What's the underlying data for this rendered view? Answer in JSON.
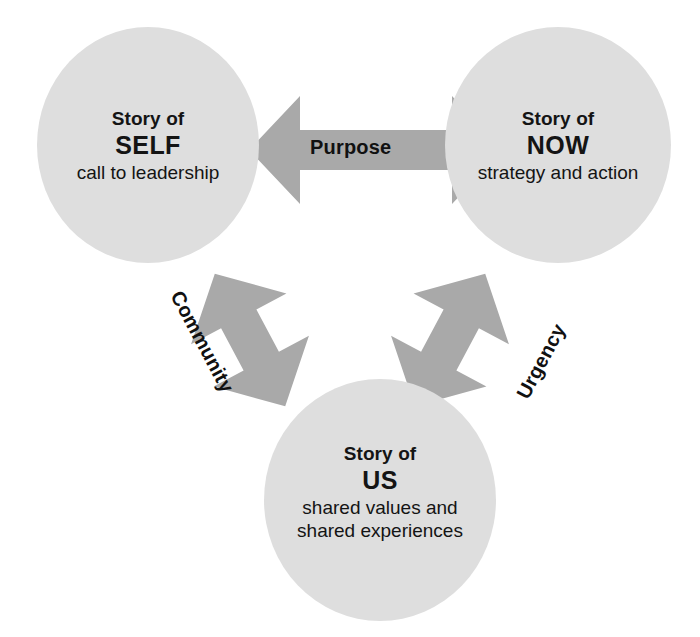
{
  "diagram": {
    "colors": {
      "circle_fill": "#dedede",
      "arrow_fill": "#a9a9a9",
      "text": "#141414",
      "background": "#ffffff"
    },
    "nodes": [
      {
        "id": "self",
        "line_top": "Story of",
        "key": "SELF",
        "subtitle": "call to leadership"
      },
      {
        "id": "now",
        "line_top": "Story of",
        "key": "NOW",
        "subtitle": "strategy and action"
      },
      {
        "id": "us",
        "line_top": "Story of",
        "key": "US",
        "subtitle_line1": "shared values and",
        "subtitle_line2": "shared experiences"
      }
    ],
    "edges": [
      {
        "id": "purpose",
        "label": "Purpose",
        "from": "self",
        "to": "now",
        "orientation": "horizontal",
        "double_headed": true
      },
      {
        "id": "community",
        "label": "Community",
        "from": "self",
        "to": "us",
        "orientation": "diagonal-down-right",
        "double_headed": true
      },
      {
        "id": "urgency",
        "label": "Urgency",
        "from": "us",
        "to": "now",
        "orientation": "diagonal-up-right",
        "double_headed": true
      }
    ]
  }
}
